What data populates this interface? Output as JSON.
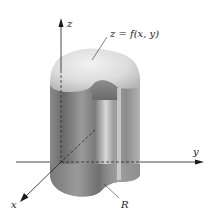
{
  "diagram": {
    "type": "3d-solid-under-surface",
    "labels": {
      "z_axis": "z",
      "y_axis": "y",
      "x_axis": "x",
      "surface": "z = f(x, y)",
      "region": "R"
    },
    "colors": {
      "axis": "#1a1a1a",
      "solid_dark": "#6e6e6e",
      "solid_mid": "#a8a8a8",
      "solid_light": "#d6d6d6",
      "cap_light": "#ebebeb",
      "cap_shadow": "#bdbdbd"
    }
  }
}
